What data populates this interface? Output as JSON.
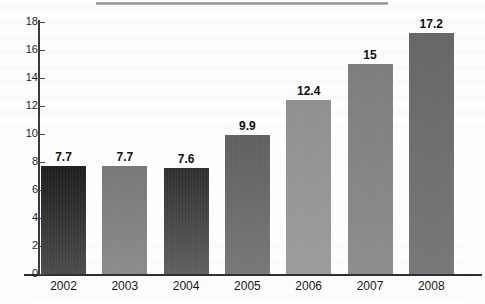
{
  "chart_data": {
    "type": "bar",
    "title": "",
    "xlabel": "",
    "ylabel": "",
    "categories": [
      "2002",
      "2003",
      "2004",
      "2005",
      "2006",
      "2007",
      "2008"
    ],
    "values": [
      7.7,
      7.7,
      7.6,
      9.9,
      12.4,
      15,
      17.2
    ],
    "value_labels": [
      "7.7",
      "7.7",
      "7.6",
      "9.9",
      "12.4",
      "15",
      "17.2"
    ],
    "ylim": [
      0,
      18
    ],
    "y_ticks": [
      0,
      2,
      4,
      6,
      8,
      10,
      12,
      14,
      16,
      18
    ],
    "y_tick_labels": [
      "0",
      "2",
      "4",
      "6",
      "8",
      "10",
      "12",
      "14",
      "16",
      "18"
    ],
    "grid": false,
    "legend": null,
    "series": [
      {
        "name": "",
        "values": [
          7.7,
          7.7,
          7.6,
          9.9,
          12.4,
          15,
          17.2
        ]
      }
    ],
    "bar_colors": [
      {
        "top": "#1b1b1b",
        "bottom": "#4a4a4a"
      },
      {
        "top": "#757575",
        "bottom": "#8a8a8a"
      },
      {
        "top": "#2d2d2d",
        "bottom": "#5e5e5e"
      },
      {
        "top": "#5d5d5d",
        "bottom": "#767676"
      },
      {
        "top": "#8e8e8e",
        "bottom": "#9a9a9a"
      },
      {
        "top": "#7b7b7b",
        "bottom": "#8b8b8b"
      },
      {
        "top": "#646464",
        "bottom": "#757575"
      }
    ],
    "axis_color": "#2f2f2f"
  },
  "artifacts": {
    "top_rule": "scan-rule",
    "background": "faint-bleed-through-text"
  }
}
